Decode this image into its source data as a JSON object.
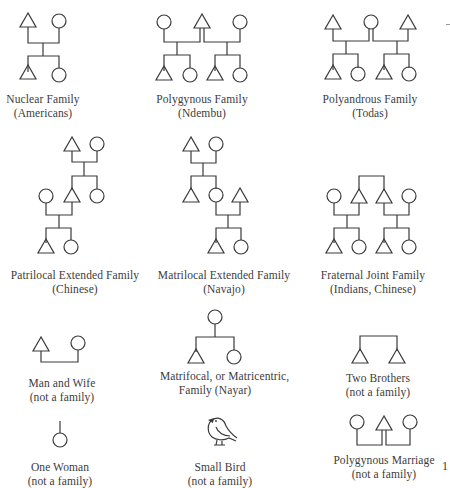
{
  "figure": {
    "symbols": {
      "male": "triangle",
      "female": "circle",
      "marriage": "bracket-line",
      "descent": "vertical-line"
    },
    "panels": [
      {
        "id": "nuclear",
        "title": "Nuclear Family",
        "subtitle": "(Americans)"
      },
      {
        "id": "polygynous",
        "title": "Polygynous Family",
        "subtitle": "(Ndembu)"
      },
      {
        "id": "polyandrous",
        "title": "Polyandrous Family",
        "subtitle": "(Todas)"
      },
      {
        "id": "patrilocal",
        "title": "Patrilocal Extended Family",
        "subtitle": "(Chinese)"
      },
      {
        "id": "matrilocal",
        "title": "Matrilocal Extended Family",
        "subtitle": "(Navajo)"
      },
      {
        "id": "fraternal",
        "title": "Fraternal Joint Family",
        "subtitle": "(Indians, Chinese)"
      },
      {
        "id": "man-wife",
        "title": "Man and Wife",
        "subtitle": "(not a family)"
      },
      {
        "id": "matrifocal",
        "title": "Matrifocal, or Matricentric,",
        "subtitle": "Family (Nayar)"
      },
      {
        "id": "two-brothers",
        "title": "Two Brothers",
        "subtitle": "(not a family)"
      },
      {
        "id": "one-woman",
        "title": "One Woman",
        "subtitle": "(not a family)"
      },
      {
        "id": "small-bird",
        "title": "Small Bird",
        "subtitle": "(not a family)"
      },
      {
        "id": "polygynous-marriage",
        "title": "Polygynous Marriage",
        "subtitle": "(not a family)"
      }
    ],
    "page_number": "1"
  }
}
